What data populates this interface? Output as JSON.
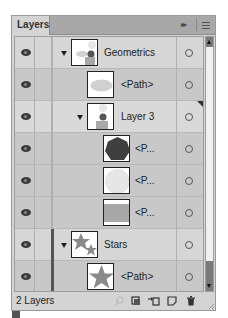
{
  "panel": {
    "tab_label": "Layers",
    "collapse_icon": "double-chevron-right-icon",
    "menu_icon": "panel-menu-icon"
  },
  "layers": [
    {
      "name": "Geometrics",
      "level": 0,
      "kind": "layer",
      "expanded": true,
      "thumbnail": "geometrics",
      "visible": true
    },
    {
      "name": "<Path>",
      "level": 1,
      "kind": "path",
      "thumbnail": "ellipse",
      "visible": true
    },
    {
      "name": "Layer 3",
      "level": 1,
      "kind": "layer",
      "expanded": true,
      "thumbnail": "layer3",
      "visible": true,
      "selected_art": true
    },
    {
      "name": "<P...",
      "level": 2,
      "kind": "path",
      "thumbnail": "heptagon",
      "visible": true
    },
    {
      "name": "<P...",
      "level": 2,
      "kind": "path",
      "thumbnail": "circle",
      "visible": true
    },
    {
      "name": "<P...",
      "level": 2,
      "kind": "path",
      "thumbnail": "rectangle",
      "visible": true
    },
    {
      "name": "Stars",
      "level": 0,
      "kind": "layer",
      "expanded": true,
      "thumbnail": "stars",
      "visible": true
    },
    {
      "name": "<Path>",
      "level": 1,
      "kind": "path",
      "thumbnail": "star",
      "visible": true
    }
  ],
  "footer": {
    "count_label": "2 Layers",
    "buttons": [
      {
        "name": "locate-object",
        "icon": "search-icon"
      },
      {
        "name": "make-clipping-mask",
        "icon": "clipping-mask-icon"
      },
      {
        "name": "create-sublayer",
        "icon": "new-sublayer-icon"
      },
      {
        "name": "create-layer",
        "icon": "new-layer-icon"
      },
      {
        "name": "delete",
        "icon": "trash-icon"
      }
    ]
  },
  "colors": {
    "shape_fill": "#8a8a8a",
    "dark_fill": "#3f3f3f",
    "light_fill": "#e6e6e6"
  }
}
